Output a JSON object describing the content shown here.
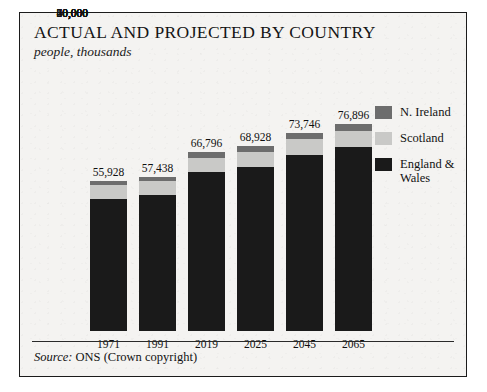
{
  "title": "ACTUAL AND PROJECTED BY COUNTRY",
  "subtitle": "people, thousands",
  "source": {
    "label": "Source:",
    "text": "ONS (Crown copyright)"
  },
  "legend": {
    "position": "right",
    "items": [
      {
        "label": "N. Ireland",
        "color": "#6d6d6d"
      },
      {
        "label": "Scotland",
        "color": "#c9c9c7"
      },
      {
        "label": "England & Wales",
        "color": "#1a1a1a"
      }
    ]
  },
  "axis": {
    "y_ticks": [
      "80,000",
      "70,000",
      "60,000",
      "50,000",
      "40,000",
      "30,000",
      "20,000",
      "10,000",
      "0"
    ],
    "y_min": 0,
    "y_max": 80000,
    "y_step": 10000
  },
  "bar_labels": [
    "55,928",
    "57,438",
    "66,796",
    "68,928",
    "73,746",
    "76,896"
  ],
  "chart_data": {
    "type": "bar",
    "title": "ACTUAL AND PROJECTED BY COUNTRY",
    "subtitle": "people, thousands",
    "xlabel": "",
    "ylabel": "people, thousands",
    "ylim": [
      0,
      80000
    ],
    "ytick_step": 10000,
    "grid": false,
    "stacked": true,
    "legend_position": "right",
    "categories": [
      "1971",
      "1991",
      "2019",
      "2025",
      "2045",
      "2065"
    ],
    "totals": [
      55928,
      57438,
      66796,
      68928,
      73746,
      76896
    ],
    "total_labels": [
      "55,928",
      "57,438",
      "66,796",
      "68,928",
      "73,746",
      "76,896"
    ],
    "series": [
      {
        "name": "England & Wales",
        "color": "#1a1a1a",
        "values": [
          49152,
          50748,
          59116,
          61067,
          65636,
          68618
        ]
      },
      {
        "name": "Scotland",
        "color": "#c9c9c7",
        "values": [
          5236,
          5083,
          5438,
          5565,
          5767,
          5828
        ]
      },
      {
        "name": "N. Ireland",
        "color": "#6d6d6d",
        "values": [
          1540,
          1607,
          2242,
          2296,
          2343,
          2450
        ]
      }
    ]
  }
}
